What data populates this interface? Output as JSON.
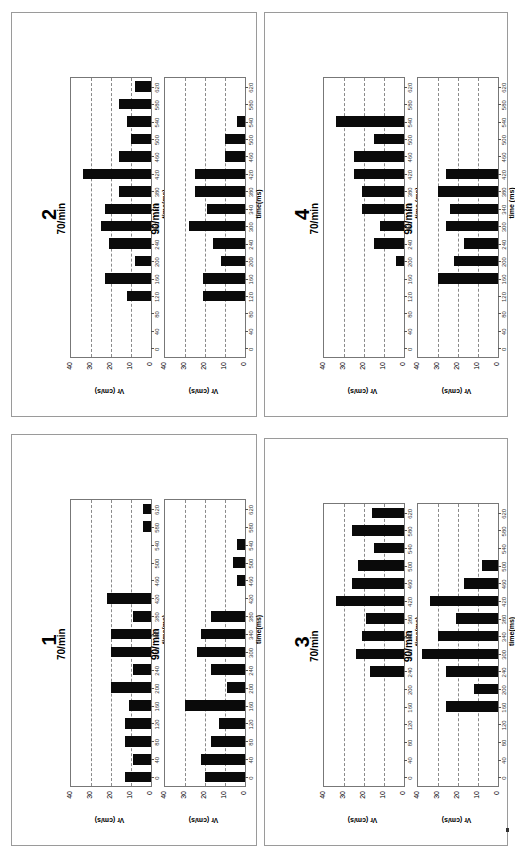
{
  "figure": {
    "y_axis_label": "Vr (cm/s)",
    "x_axis_label_variants": [
      "time(ms)",
      "time (ms)"
    ],
    "y_ticks": [
      "0",
      "10",
      "20",
      "30",
      "40"
    ],
    "x_ticks": [
      "0",
      "40",
      "80",
      "120",
      "160",
      "200",
      "240",
      "300",
      "340",
      "380",
      "420",
      "460",
      "500",
      "540",
      "580",
      "620"
    ]
  },
  "panels": [
    {
      "id": "1",
      "label": "1",
      "charts": [
        {
          "title": "70/min"
        },
        {
          "title": "90/min"
        }
      ]
    },
    {
      "id": "2",
      "label": "2",
      "charts": [
        {
          "title": "70/min"
        },
        {
          "title": "90/min"
        }
      ]
    },
    {
      "id": "3",
      "label": "3",
      "charts": [
        {
          "title": "70/min"
        },
        {
          "title": "90/min"
        }
      ]
    },
    {
      "id": "4",
      "label": "4",
      "charts": [
        {
          "title": "70/min"
        },
        {
          "title": "90/min"
        }
      ]
    }
  ],
  "chart_data": [
    {
      "panel": "1",
      "type": "bar",
      "title": "70/min",
      "xlabel": "time(ms)",
      "ylabel": "Vr (cm/s)",
      "ylim": [
        0,
        40
      ],
      "categories": [
        "0",
        "40",
        "80",
        "120",
        "160",
        "200",
        "240",
        "300",
        "340",
        "380",
        "420",
        "460",
        "500",
        "540",
        "580",
        "620"
      ],
      "values": [
        13,
        9,
        13,
        13,
        11,
        20,
        9,
        20,
        20,
        9,
        22,
        0,
        0,
        0,
        4,
        4
      ],
      "grid": "dashed y",
      "legend": "none"
    },
    {
      "panel": "1",
      "type": "bar",
      "title": "90/min",
      "xlabel": "time(ms)",
      "ylabel": "Vr (cm/s)",
      "ylim": [
        0,
        40
      ],
      "categories": [
        "0",
        "40",
        "80",
        "120",
        "160",
        "200",
        "240",
        "300",
        "340",
        "380",
        "420",
        "460",
        "500",
        "540",
        "580",
        "620"
      ],
      "values": [
        20,
        22,
        17,
        13,
        30,
        9,
        17,
        24,
        22,
        17,
        0,
        4,
        6,
        4,
        0,
        0
      ],
      "grid": "dashed y",
      "legend": "none"
    },
    {
      "panel": "2",
      "type": "bar",
      "title": "70/min",
      "xlabel": "time(ms)",
      "ylabel": "Vr (cm/s)",
      "ylim": [
        0,
        40
      ],
      "categories": [
        "0",
        "40",
        "80",
        "120",
        "160",
        "200",
        "240",
        "300",
        "340",
        "380",
        "420",
        "460",
        "500",
        "540",
        "580",
        "620"
      ],
      "values": [
        0,
        0,
        0,
        12,
        23,
        8,
        21,
        25,
        23,
        16,
        34,
        16,
        10,
        12,
        16,
        8
      ],
      "grid": "dashed y",
      "legend": "none"
    },
    {
      "panel": "2",
      "type": "bar",
      "title": "90/min",
      "xlabel": "time(ms)",
      "ylabel": "Vr (cm/s)",
      "ylim": [
        0,
        40
      ],
      "categories": [
        "0",
        "40",
        "80",
        "120",
        "160",
        "200",
        "240",
        "300",
        "340",
        "380",
        "420",
        "460",
        "500",
        "540",
        "580",
        "620"
      ],
      "values": [
        0,
        0,
        0,
        21,
        21,
        12,
        16,
        28,
        19,
        25,
        25,
        10,
        10,
        4,
        0,
        0
      ],
      "grid": "dashed y",
      "legend": "none"
    },
    {
      "panel": "3",
      "type": "bar",
      "title": "70/min",
      "xlabel": "time(ms)",
      "ylabel": "Vr (cm/s)",
      "ylim": [
        0,
        40
      ],
      "categories": [
        "0",
        "40",
        "80",
        "120",
        "160",
        "200",
        "240",
        "300",
        "340",
        "380",
        "420",
        "460",
        "500",
        "540",
        "580",
        "620"
      ],
      "values": [
        0,
        0,
        0,
        0,
        0,
        0,
        17,
        24,
        21,
        19,
        34,
        26,
        23,
        15,
        26,
        16
      ],
      "grid": "dashed y",
      "legend": "none"
    },
    {
      "panel": "3",
      "type": "bar",
      "title": "90/min",
      "xlabel": "time(ms)",
      "ylabel": "Vr (cm/s)",
      "ylim": [
        0,
        40
      ],
      "categories": [
        "0",
        "40",
        "80",
        "120",
        "160",
        "200",
        "240",
        "300",
        "340",
        "380",
        "420",
        "460",
        "500",
        "540",
        "580",
        "620"
      ],
      "values": [
        0,
        0,
        0,
        0,
        26,
        12,
        26,
        38,
        30,
        21,
        34,
        17,
        8,
        0,
        0,
        0
      ],
      "grid": "dashed y",
      "legend": "none"
    },
    {
      "panel": "4",
      "type": "bar",
      "title": "70/min",
      "xlabel": "time (ms)",
      "ylabel": "Vr (cm/s)",
      "ylim": [
        0,
        40
      ],
      "categories": [
        "0",
        "40",
        "80",
        "120",
        "160",
        "200",
        "240",
        "300",
        "340",
        "380",
        "420",
        "460",
        "500",
        "540",
        "580",
        "620"
      ],
      "values": [
        0,
        0,
        0,
        0,
        0,
        4,
        15,
        12,
        21,
        21,
        25,
        25,
        15,
        34,
        0,
        0
      ],
      "grid": "dashed y",
      "legend": "none"
    },
    {
      "panel": "4",
      "type": "bar",
      "title": "90/min",
      "xlabel": "time (ms)",
      "ylabel": "Vr (cm/s)",
      "ylim": [
        0,
        40
      ],
      "categories": [
        "0",
        "40",
        "80",
        "120",
        "160",
        "200",
        "240",
        "300",
        "340",
        "380",
        "420",
        "460",
        "500",
        "540",
        "580",
        "620"
      ],
      "values": [
        0,
        0,
        0,
        0,
        30,
        22,
        17,
        26,
        24,
        30,
        26,
        0,
        0,
        0,
        0,
        0
      ],
      "grid": "dashed y",
      "legend": "none"
    }
  ]
}
